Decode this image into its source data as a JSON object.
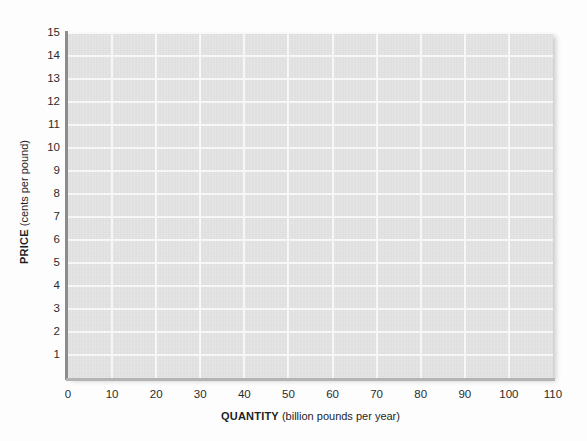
{
  "chart_data": {
    "type": "line",
    "title": "",
    "subtitle": "",
    "xlabel_bold": "QUANTITY",
    "xlabel_rest": " (billion pounds per year)",
    "ylabel_bold": "PRICE",
    "ylabel_rest": " (cents per pound)",
    "xlim": [
      0,
      110
    ],
    "ylim": [
      0,
      15
    ],
    "xticks": [
      0,
      10,
      20,
      30,
      40,
      50,
      60,
      70,
      80,
      90,
      100,
      110
    ],
    "yticks": [
      1,
      2,
      3,
      4,
      5,
      6,
      7,
      8,
      9,
      10,
      11,
      12,
      13,
      14,
      15
    ],
    "xtick_labels": [
      "0",
      "10",
      "20",
      "30",
      "40",
      "50",
      "60",
      "70",
      "80",
      "90",
      "100",
      "110"
    ],
    "ytick_labels": [
      "1",
      "2",
      "3",
      "4",
      "5",
      "6",
      "7",
      "8",
      "9",
      "10",
      "11",
      "12",
      "13",
      "14",
      "15"
    ],
    "grid": true,
    "grid_x_step": 10,
    "grid_y_step": 1,
    "legend": null,
    "series": [],
    "annotations": [],
    "colors": {
      "plot_background": "#e4e4e4",
      "gridline": "#fafafa",
      "y_axis_line": "#8c8c8c",
      "x_axis_line": "#b4b4b4",
      "tick_text": "#2b2b2b",
      "axis_title_text": "#1f1f1f",
      "page_background": "#fdfdfd"
    }
  }
}
